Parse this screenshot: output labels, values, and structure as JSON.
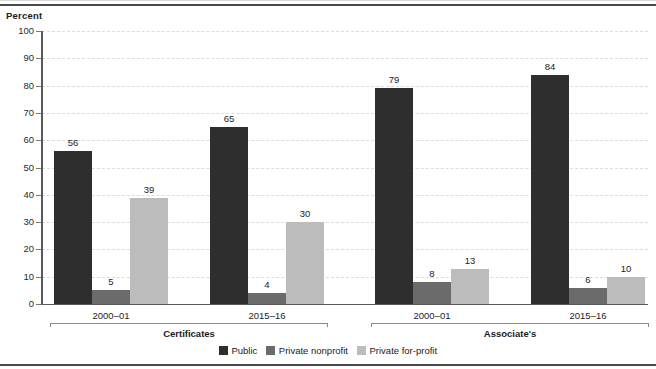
{
  "chart_data": {
    "type": "bar",
    "title": "",
    "xlabel": "",
    "ylabel": "Percent",
    "ylim": [
      0,
      100
    ],
    "ytick_step": 10,
    "yticks": [
      100,
      90,
      80,
      70,
      60,
      50,
      40,
      30,
      20,
      10,
      0
    ],
    "grid": true,
    "legend_position": "bottom-center",
    "categories": [
      "2000–01",
      "2015–16",
      "2000–01",
      "2015–16"
    ],
    "groups": [
      {
        "label": "Certificates",
        "categories": [
          "2000–01",
          "2015–16"
        ],
        "values": {
          "Public": [
            56,
            65
          ],
          "Private nonprofit": [
            5,
            4
          ],
          "Private for-profit": [
            39,
            30
          ]
        }
      },
      {
        "label": "Associate's",
        "categories": [
          "2000–01",
          "2015–16"
        ],
        "values": {
          "Public": [
            79,
            84
          ],
          "Private nonprofit": [
            8,
            6
          ],
          "Private for-profit": [
            13,
            10
          ]
        }
      }
    ],
    "series": [
      {
        "name": "Public",
        "color": "#2e2e2e",
        "values": [
          56,
          65,
          79,
          84
        ]
      },
      {
        "name": "Private nonprofit",
        "color": "#6b6b6b",
        "values": [
          5,
          4,
          8,
          6
        ]
      },
      {
        "name": "Private for-profit",
        "color": "#bcbcbc",
        "values": [
          39,
          30,
          13,
          10
        ]
      }
    ]
  },
  "axis": {
    "y_title": "Percent",
    "ticks": [
      "100",
      "90",
      "80",
      "70",
      "60",
      "50",
      "40",
      "30",
      "20",
      "10",
      "0"
    ]
  },
  "legend": {
    "items": [
      {
        "label": "Public",
        "color": "#2e2e2e"
      },
      {
        "label": "Private nonprofit",
        "color": "#6b6b6b"
      },
      {
        "label": "Private for-profit",
        "color": "#bcbcbc"
      }
    ]
  },
  "group_labels": [
    "Certificates",
    "Associate's"
  ],
  "category_labels": [
    "2000–01",
    "2015–16",
    "2000–01",
    "2015–16"
  ],
  "bar_value_labels": [
    "56",
    "5",
    "39",
    "65",
    "4",
    "30",
    "79",
    "8",
    "13",
    "84",
    "6",
    "10"
  ],
  "colors": {
    "public": "#2e2e2e",
    "nonprofit": "#6b6b6b",
    "forprofit": "#bcbcbc",
    "axis": "#5a5a5a",
    "grid": "#dcdcdc",
    "text": "#1c1c1c",
    "rule": "#4a4a4a"
  }
}
